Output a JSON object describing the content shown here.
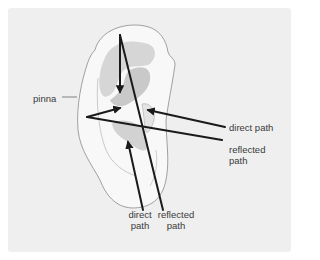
{
  "diagram": {
    "colors": {
      "background": "#ffffff",
      "panel": "#efefef",
      "ear_fill": "#f8f8f8",
      "ear_shadow": "#c9c9c9",
      "ear_outline": "#8a8a8a",
      "arrow": "#1a1a1a",
      "label_text": "#3a3a3a"
    },
    "labels": {
      "pinna": "pinna",
      "right_direct": {
        "line1": "direct path"
      },
      "right_reflected": {
        "line1": "reflected",
        "line2": "path"
      },
      "bottom_direct": {
        "line1": "direct",
        "line2": "path"
      },
      "bottom_reflected": {
        "line1": "reflected",
        "line2": "path"
      }
    },
    "arrows": [
      {
        "name": "top-reflected-down",
        "from": [
          120,
          35
        ],
        "to": [
          120,
          92
        ],
        "head": "end"
      },
      {
        "name": "left-reflected-into-canal",
        "from": [
          87,
          117
        ],
        "to": [
          120,
          108
        ],
        "head": "end"
      },
      {
        "name": "right-direct-path",
        "from": [
          225,
          127
        ],
        "to": [
          147,
          110
        ],
        "head": "end"
      },
      {
        "name": "bottom-direct-path",
        "from": [
          143,
          210
        ],
        "to": [
          128,
          142
        ],
        "head": "end"
      },
      {
        "name": "right-reflected-line",
        "from": [
          87,
          117
        ],
        "to": [
          222,
          140
        ],
        "head": "none"
      },
      {
        "name": "bottom-reflected-line",
        "from": [
          120,
          35
        ],
        "to": [
          163,
          210
        ],
        "head": "none"
      }
    ]
  }
}
